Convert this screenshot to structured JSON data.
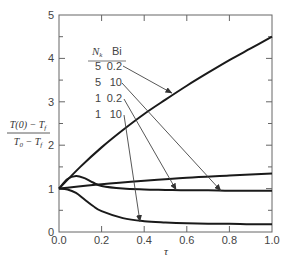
{
  "chart_data": {
    "type": "line",
    "title": "",
    "xlabel": "τ",
    "ylabel": "(T(0) − T_f) / (T_0 − T_f)",
    "ylabel_numerator": "T(0) − T",
    "ylabel_denominator": "T",
    "xlim": [
      0.0,
      1.0
    ],
    "ylim": [
      0,
      5
    ],
    "grid": false,
    "x_ticks": [
      "0.0",
      "0.2",
      "0.4",
      "0.6",
      "0.8",
      "1.0"
    ],
    "y_ticks": [
      "0",
      "1",
      "2",
      "3",
      "4",
      "5"
    ],
    "legend": {
      "header": [
        "N_k",
        "Bi"
      ],
      "header_nk": "N",
      "header_nk_sub": "k",
      "header_bi": "Bi",
      "position": "upper-left inside",
      "rows": [
        {
          "nk": "5",
          "bi": "0.2"
        },
        {
          "nk": "5",
          "bi": "10"
        },
        {
          "nk": "1",
          "bi": "0.2"
        },
        {
          "nk": "1",
          "bi": "10"
        }
      ]
    },
    "series": [
      {
        "name": "Nk=5, Bi=0.2",
        "x": [
          0.0,
          0.1,
          0.2,
          0.3,
          0.4,
          0.5,
          0.6,
          0.7,
          0.8,
          0.9,
          1.0
        ],
        "values": [
          1.0,
          1.5,
          1.95,
          2.35,
          2.72,
          3.05,
          3.37,
          3.67,
          3.96,
          4.23,
          4.5
        ]
      },
      {
        "name": "Nk=5, Bi=10",
        "x": [
          0.0,
          0.04,
          0.08,
          0.12,
          0.16,
          0.2,
          0.3,
          0.4,
          0.5,
          0.6,
          0.7,
          0.8,
          0.9,
          1.0
        ],
        "values": [
          1.0,
          1.22,
          1.29,
          1.24,
          1.14,
          1.06,
          1.0,
          0.98,
          0.97,
          0.96,
          0.96,
          0.95,
          0.95,
          0.95
        ]
      },
      {
        "name": "Nk=1, Bi=0.2",
        "x": [
          0.0,
          0.2,
          0.4,
          0.6,
          0.8,
          1.0
        ],
        "values": [
          1.0,
          1.1,
          1.18,
          1.25,
          1.3,
          1.35
        ]
      },
      {
        "name": "Nk=1, Bi=10",
        "x": [
          0.0,
          0.04,
          0.08,
          0.12,
          0.16,
          0.2,
          0.3,
          0.4,
          0.5,
          0.6,
          0.7,
          0.8,
          0.9,
          1.0
        ],
        "values": [
          1.0,
          0.98,
          0.9,
          0.75,
          0.6,
          0.48,
          0.32,
          0.25,
          0.22,
          0.2,
          0.19,
          0.19,
          0.18,
          0.18
        ]
      }
    ],
    "annotations": [
      {
        "from_legend_row": 0,
        "points_to_tau": 0.53,
        "points_to_value": 3.2
      },
      {
        "from_legend_row": 1,
        "points_to_tau": 0.76,
        "points_to_value": 0.95
      },
      {
        "from_legend_row": 2,
        "points_to_tau": 0.55,
        "points_to_value": 0.97
      },
      {
        "from_legend_row": 3,
        "points_to_tau": 0.38,
        "points_to_value": 0.24
      }
    ]
  }
}
